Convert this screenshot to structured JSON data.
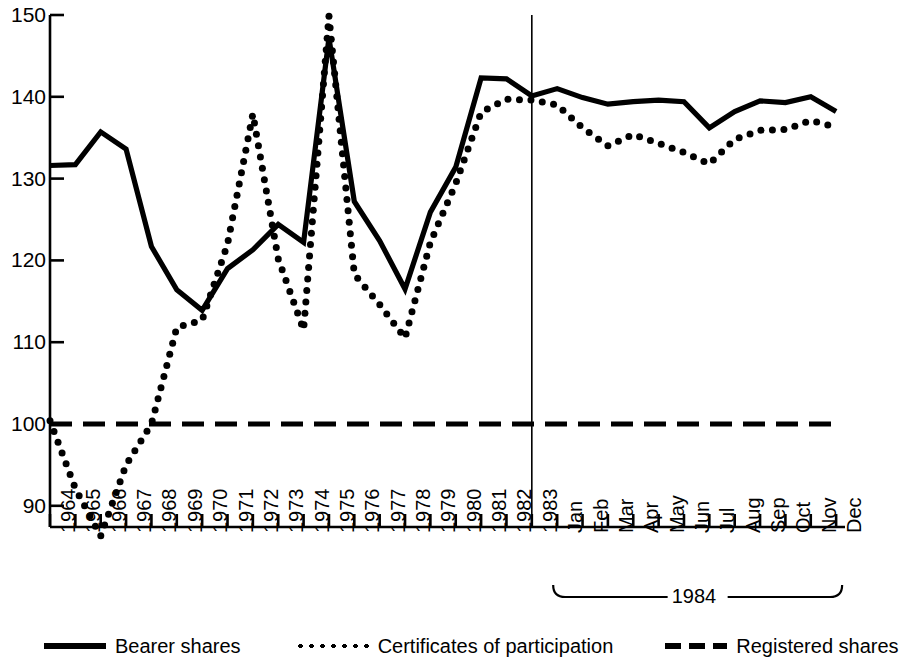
{
  "chart_data": {
    "type": "line",
    "title": "",
    "subtitle": "",
    "xlabel": "",
    "ylabel": "",
    "ylim": [
      86,
      150
    ],
    "yticks": [
      90,
      100,
      110,
      120,
      130,
      140,
      150
    ],
    "ytick_labels": [
      "90",
      "100",
      "110",
      "120",
      "130",
      "140",
      "150"
    ],
    "grid": false,
    "legend_position": "bottom",
    "x": [
      "1964",
      "1965",
      "1966",
      "1967",
      "1968",
      "1969",
      "1970",
      "1971",
      "1972",
      "1973",
      "1974",
      "1975",
      "1976",
      "1977",
      "1978",
      "1979",
      "1980",
      "1981",
      "1982",
      "1983",
      "Jan",
      "Feb",
      "Mar",
      "Apr",
      "May",
      "Jun",
      "Jul",
      "Aug",
      "Sep",
      "Oct",
      "Nov",
      "Dec"
    ],
    "xtick_labels": [
      "1964",
      "1965",
      "1966",
      "1967",
      "1968",
      "1969",
      "1970",
      "1971",
      "1972",
      "1973",
      "1974",
      "1975",
      "1976",
      "1977",
      "1978",
      "1979",
      "1980",
      "1981",
      "1982",
      "1983",
      "Jan",
      "Feb",
      "Mar",
      "Apr",
      "May",
      "Jun",
      "Jul",
      "Aug",
      "Sep",
      "Oct",
      "Nov",
      "Dec"
    ],
    "month_group_label": "1984",
    "month_group_range": [
      "Jan",
      "Dec"
    ],
    "annotations": [
      {
        "type": "vertical-line",
        "at": "1983",
        "note": "separator between annual and monthly sections"
      },
      {
        "type": "brace",
        "label": "1984",
        "from": "Jan",
        "to": "Dec"
      }
    ],
    "series": [
      {
        "name": "Bearer shares",
        "style": "solid",
        "color": "#000000",
        "values": [
          131.6,
          131.7,
          135.7,
          133.6,
          121.7,
          116.4,
          113.9,
          119.0,
          121.3,
          124.4,
          122.2,
          147.2,
          127.2,
          122.4,
          116.5,
          125.9,
          131.4,
          142.3,
          142.2,
          140.1,
          141.0,
          139.9,
          139.1,
          139.4,
          139.6,
          139.4,
          136.2,
          138.2,
          139.5,
          139.3,
          140.0,
          138.2
        ]
      },
      {
        "name": "Certificates of participation",
        "style": "dotted",
        "color": "#000000",
        "values": [
          100.4,
          92.1,
          86.3,
          95.0,
          100.0,
          111.8,
          112.7,
          122.0,
          137.9,
          120.2,
          111.5,
          149.9,
          118.3,
          114.6,
          110.5,
          122.2,
          129.4,
          138.1,
          139.7,
          139.6,
          139.0,
          136.2,
          134.0,
          135.4,
          134.3,
          133.2,
          131.8,
          134.8,
          135.9,
          136.0,
          137.1,
          136.3
        ]
      },
      {
        "name": "Registered shares",
        "style": "dashed",
        "color": "#000000",
        "values": [
          100,
          100,
          100,
          100,
          100,
          100,
          100,
          100,
          100,
          100,
          100,
          100,
          100,
          100,
          100,
          100,
          100,
          100,
          100,
          100,
          100,
          100,
          100,
          100,
          100,
          100,
          100,
          100,
          100,
          100,
          100,
          100
        ]
      }
    ]
  },
  "legend": {
    "items": [
      {
        "label": "Bearer shares",
        "style": "solid"
      },
      {
        "label": "Certificates of participation",
        "style": "dotted"
      },
      {
        "label": "Registered shares",
        "style": "dashed"
      }
    ]
  }
}
